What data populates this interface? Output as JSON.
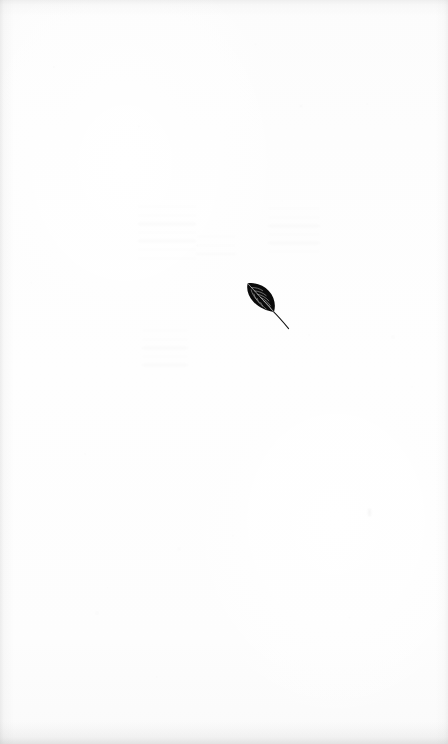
{
  "page": {
    "kind": "scanned-book-page",
    "width": 448,
    "height": 744,
    "paper_color": "#fdfdfd",
    "ink_color": "#0a0a0a",
    "edge_shadow_color": "#8c8c8c",
    "visible_text": "",
    "page_number": "",
    "running_head": ""
  },
  "illustration": {
    "name": "leaf",
    "label": "leaf",
    "description": "small dark leaf silhouette with midrib and lateral veins, blade tilted with apex up-left and a thin stem trailing to the lower-right",
    "ink_color": "#0a0a0a",
    "vein_color": "#d8d8d8",
    "position": {
      "x": 198,
      "y": 258
    },
    "blade": {
      "x": 207,
      "y": 267,
      "width": 26,
      "height": 28
    },
    "stem": {
      "from_x": 233,
      "from_y": 294,
      "to_x": 248,
      "to_y": 312
    },
    "rotation_degrees": 38
  },
  "artifacts": {
    "show_through_marks": [
      {
        "name": "ghost-block-upper-left",
        "x": 138,
        "y": 206,
        "width": 58,
        "height": 54,
        "opacity": 0.03
      },
      {
        "name": "ghost-block-upper-right",
        "x": 268,
        "y": 208,
        "width": 52,
        "height": 44,
        "opacity": 0.026
      },
      {
        "name": "ghost-block-lower-left",
        "x": 142,
        "y": 330,
        "width": 46,
        "height": 36,
        "opacity": 0.028
      },
      {
        "name": "ghost-smudge-center",
        "x": 196,
        "y": 236,
        "width": 40,
        "height": 26,
        "opacity": 0.022
      }
    ],
    "speck_marks": [
      {
        "name": "speck-right-lower",
        "x": 368,
        "y": 509,
        "width": 3,
        "height": 7,
        "opacity": 0.06
      },
      {
        "name": "speck-center-low",
        "x": 178,
        "y": 548,
        "width": 2,
        "height": 2,
        "opacity": 0.05
      },
      {
        "name": "speck-right-top",
        "x": 300,
        "y": 105,
        "width": 2,
        "height": 2,
        "opacity": 0.045
      },
      {
        "name": "speck-left-mid",
        "x": 96,
        "y": 612,
        "width": 2,
        "height": 2,
        "opacity": 0.04
      },
      {
        "name": "speck-right-mid",
        "x": 392,
        "y": 336,
        "width": 2,
        "height": 2,
        "opacity": 0.04
      }
    ]
  }
}
